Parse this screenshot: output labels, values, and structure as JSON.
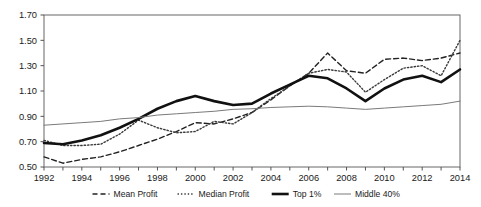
{
  "chart_data": {
    "type": "line",
    "title": "",
    "subtitle": "",
    "xlabel": "",
    "ylabel": "",
    "xlim": [
      1992,
      2014
    ],
    "ylim": [
      0.5,
      1.7
    ],
    "grid": false,
    "legend_position": "bottom",
    "x": [
      1992,
      1993,
      1994,
      1995,
      1996,
      1997,
      1998,
      1999,
      2000,
      2001,
      2002,
      2003,
      2004,
      2005,
      2006,
      2007,
      2008,
      2009,
      2010,
      2011,
      2012,
      2013,
      2014
    ],
    "x_tick_labels": [
      "1992",
      "1994",
      "1996",
      "1998",
      "2000",
      "2002",
      "2004",
      "2006",
      "2008",
      "2010",
      "2012",
      "2014"
    ],
    "y_tick_labels": [
      "0.50",
      "0.70",
      "0.90",
      "1.10",
      "1.30",
      "1.50",
      "1.70"
    ],
    "y_ticks": [
      0.5,
      0.7,
      0.9,
      1.1,
      1.3,
      1.5,
      1.7
    ],
    "series": [
      {
        "name": "Mean Profit",
        "style": "dashed",
        "color": "#222222",
        "width": 1.4,
        "values": [
          0.58,
          0.53,
          0.56,
          0.58,
          0.62,
          0.67,
          0.72,
          0.78,
          0.85,
          0.84,
          0.88,
          0.93,
          1.03,
          1.14,
          1.24,
          1.4,
          1.26,
          1.24,
          1.35,
          1.36,
          1.34,
          1.36,
          1.4
        ]
      },
      {
        "name": "Median Profit",
        "style": "dotted",
        "color": "#3a3a3a",
        "width": 1.4,
        "values": [
          0.71,
          0.67,
          0.67,
          0.68,
          0.76,
          0.87,
          0.81,
          0.77,
          0.78,
          0.86,
          0.84,
          0.93,
          1.04,
          1.14,
          1.24,
          1.27,
          1.25,
          1.09,
          1.19,
          1.28,
          1.3,
          1.22,
          1.5
        ]
      },
      {
        "name": "Top 1%",
        "style": "solid-thick",
        "color": "#111111",
        "width": 2.6,
        "values": [
          0.69,
          0.68,
          0.71,
          0.75,
          0.81,
          0.88,
          0.96,
          1.02,
          1.06,
          1.02,
          0.99,
          1.0,
          1.08,
          1.15,
          1.22,
          1.2,
          1.12,
          1.02,
          1.12,
          1.19,
          1.22,
          1.17,
          1.27
        ]
      },
      {
        "name": "Middle 40%",
        "style": "solid-thin",
        "color": "#7a7a7a",
        "width": 1.0,
        "values": [
          0.83,
          0.84,
          0.85,
          0.86,
          0.88,
          0.89,
          0.91,
          0.92,
          0.93,
          0.94,
          0.955,
          0.96,
          0.97,
          0.975,
          0.98,
          0.975,
          0.965,
          0.955,
          0.965,
          0.975,
          0.985,
          0.995,
          1.02
        ]
      }
    ],
    "legend": [
      {
        "label": "Mean Profit",
        "style": "dashed"
      },
      {
        "label": "Median Profit",
        "style": "dotted"
      },
      {
        "label": "Top 1%",
        "style": "solid-thick"
      },
      {
        "label": "Middle 40%",
        "style": "solid-thin"
      }
    ],
    "colors": {
      "axis": "#555555",
      "text": "#1a1a1a",
      "background": "#ffffff"
    }
  }
}
